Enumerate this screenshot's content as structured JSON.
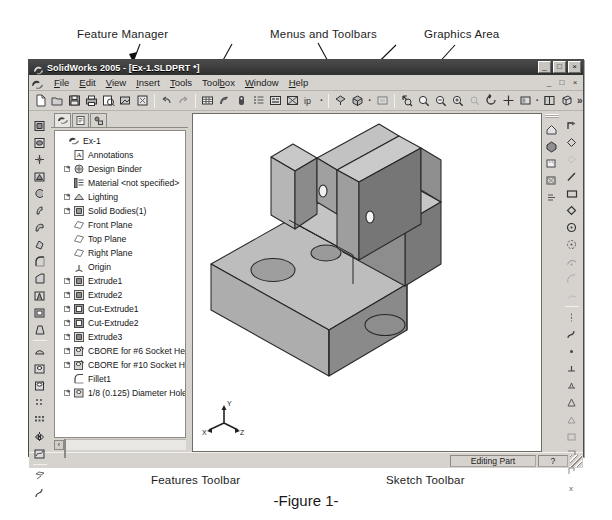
{
  "figure": {
    "caption": "-Figure 1-"
  },
  "annotations": [
    {
      "id": "feature-manager",
      "label": "Feature Manager"
    },
    {
      "id": "menus-and-toolbars",
      "label": "Menus and Toolbars"
    },
    {
      "id": "graphics-area",
      "label": "Graphics Area"
    },
    {
      "id": "features-toolbar",
      "label": "Features Toolbar"
    },
    {
      "id": "sketch-toolbar",
      "label": "Sketch Toolbar"
    }
  ],
  "window": {
    "title": "SolidWorks 2005 - [Ex-1.SLDPRT *]",
    "app_icon": "solidworks-icon",
    "controls": {
      "minimize": "_",
      "maximize": "□",
      "close": "×"
    },
    "document_controls": {
      "minimize": "_",
      "restore": "□",
      "close": "×"
    }
  },
  "menu": {
    "logo_icon": "solidworks-logo-icon",
    "items": [
      {
        "label": "File",
        "mnemonic": "F"
      },
      {
        "label": "Edit",
        "mnemonic": "E"
      },
      {
        "label": "View",
        "mnemonic": "V"
      },
      {
        "label": "Insert",
        "mnemonic": "I"
      },
      {
        "label": "Tools",
        "mnemonic": "T"
      },
      {
        "label": "Toolbox",
        "mnemonic": "b"
      },
      {
        "label": "Window",
        "mnemonic": "W"
      },
      {
        "label": "Help",
        "mnemonic": "H"
      }
    ]
  },
  "standard_toolbar": {
    "groups": [
      [
        "new-document-icon",
        "open-document-icon",
        "save-icon",
        "print-icon",
        "print-preview-icon",
        "publish-edrawings-icon",
        "select-icon"
      ],
      [
        "undo-icon",
        "redo-icon"
      ],
      [
        "rebuild-icon",
        "edit-color-icon",
        "options-icon",
        "measure-icon",
        "mass-properties-icon",
        "section-view-icon",
        "display-style-icon"
      ],
      [
        "shaded-icon",
        "view-orientation-icon",
        "appearance-icon"
      ],
      [
        "zoom-to-fit-icon",
        "zoom-to-area-icon",
        "zoom-in-out-icon",
        "zoom-to-selection-icon",
        "previous-view-icon",
        "rotate-view-icon",
        "pan-icon",
        "view-orientation-dropdown-icon",
        "display-pattern-icon",
        "shadows-icon"
      ]
    ],
    "overflow_label": "»"
  },
  "features_toolbar": {
    "title": "Features Toolbar",
    "buttons": [
      "extruded-boss-base-icon",
      "revolved-boss-base-icon",
      "swept-boss-base-icon",
      "lofted-boss-base-icon",
      "extruded-cut-icon",
      "revolved-cut-icon",
      "swept-cut-icon",
      "lofted-cut-icon",
      "fillet-icon",
      "chamfer-icon",
      "rib-icon",
      "shell-icon",
      "draft-icon",
      "dome-icon",
      "simple-hole-icon",
      "hole-wizard-icon",
      "linear-pattern-icon",
      "circular-pattern-icon",
      "mirror-icon",
      "curves-icon",
      "reference-geometry-icon"
    ]
  },
  "sketch_toolbar": {
    "title": "Sketch Toolbar",
    "buttons": [
      "sketch-icon",
      "smart-dimension-icon",
      "select-sketch-icon",
      "line-icon",
      "rectangle-icon",
      "parallelogram-icon",
      "circle-icon",
      "perimeter-circle-icon",
      "centerpoint-arc-icon",
      "tangent-arc-icon",
      "three-point-arc-icon",
      "ellipse-icon",
      "spline-icon",
      "point-icon",
      "centerline-icon",
      "text-icon",
      "offset-entities-icon",
      "convert-entities-icon",
      "trim-entities-icon",
      "extend-entities-icon",
      "mirror-entities-icon",
      "sketch-fillet-icon"
    ]
  },
  "view_toolbar": {
    "buttons": [
      "home-view-icon",
      "shaded-with-edges-icon",
      "hidden-lines-icon",
      "wireframe-icon",
      "section-icon"
    ]
  },
  "feature_manager": {
    "tabs": [
      {
        "name": "featuremanager-design-tree-tab",
        "icon": "tree-icon",
        "active": true
      },
      {
        "name": "property-manager-tab",
        "icon": "property-icon",
        "active": false
      },
      {
        "name": "configuration-manager-tab",
        "icon": "configuration-icon",
        "active": false
      }
    ],
    "tree": [
      {
        "label": "Ex-1",
        "icon": "part-icon",
        "indent": 0,
        "expandable": false
      },
      {
        "label": "Annotations",
        "icon": "annotations-icon",
        "indent": 1,
        "expandable": false
      },
      {
        "label": "Design Binder",
        "icon": "design-binder-icon",
        "indent": 1,
        "expandable": true
      },
      {
        "label": "Material <not specified>",
        "icon": "material-icon",
        "indent": 1,
        "expandable": false
      },
      {
        "label": "Lighting",
        "icon": "lighting-icon",
        "indent": 1,
        "expandable": true
      },
      {
        "label": "Solid Bodies(1)",
        "icon": "solid-bodies-icon",
        "indent": 1,
        "expandable": true
      },
      {
        "label": "Front Plane",
        "icon": "plane-icon",
        "indent": 1,
        "expandable": false
      },
      {
        "label": "Top Plane",
        "icon": "plane-icon",
        "indent": 1,
        "expandable": false
      },
      {
        "label": "Right Plane",
        "icon": "plane-icon",
        "indent": 1,
        "expandable": false
      },
      {
        "label": "Origin",
        "icon": "origin-icon",
        "indent": 1,
        "expandable": false
      },
      {
        "label": "Extrude1",
        "icon": "extrude-icon",
        "indent": 1,
        "expandable": true
      },
      {
        "label": "Extrude2",
        "icon": "extrude-icon",
        "indent": 1,
        "expandable": true
      },
      {
        "label": "Cut-Extrude1",
        "icon": "cut-extrude-icon",
        "indent": 1,
        "expandable": true
      },
      {
        "label": "Cut-Extrude2",
        "icon": "cut-extrude-icon",
        "indent": 1,
        "expandable": true
      },
      {
        "label": "Extrude3",
        "icon": "extrude-icon",
        "indent": 1,
        "expandable": true
      },
      {
        "label": "CBORE for #6 Socket Head Ca",
        "icon": "hole-wizard-icon",
        "indent": 1,
        "expandable": true
      },
      {
        "label": "CBORE for #10 Socket Head C",
        "icon": "hole-wizard-icon",
        "indent": 1,
        "expandable": true
      },
      {
        "label": "Fillet1",
        "icon": "fillet-icon",
        "indent": 1,
        "expandable": false
      },
      {
        "label": "1/8 (0.125) Diameter Hole1",
        "icon": "hole-icon",
        "indent": 1,
        "expandable": true
      }
    ],
    "scroll": {
      "left_arrow": "‹",
      "right_arrow": "›"
    }
  },
  "graphics_area": {
    "triad": {
      "x_label": "X",
      "y_label": "Y",
      "z_label": "Z"
    },
    "model_name": "stepped-block-with-counterbored-holes"
  },
  "status_bar": {
    "status": "Editing Part",
    "mode": "?"
  },
  "colors": {
    "window_face": "#d6d3ce",
    "title_bar": "#2f2f2f",
    "graphics_bg": "#ffffff",
    "model_light": "#b4b4b4",
    "model_mid": "#9a9a9a",
    "model_dark": "#707070",
    "model_edge": "#2a2a2a"
  }
}
